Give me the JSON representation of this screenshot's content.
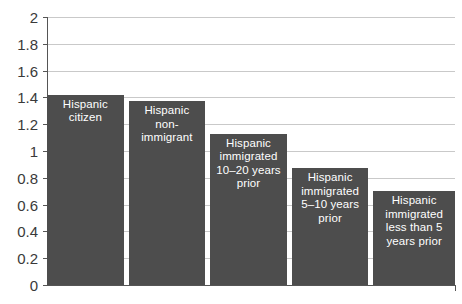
{
  "chart_data": {
    "type": "bar",
    "title": "",
    "subtitle": "",
    "xlabel": "",
    "ylabel": "",
    "ylim": [
      0,
      2
    ],
    "ytick_step": 0.2,
    "grid": true,
    "legend": null,
    "orientation": "vertical",
    "bar_color": "#4d4d4d",
    "label_color": "#ffffff",
    "axis_color": "#555555",
    "gridline_color": "#c9c9c9",
    "background_color": "#ffffff",
    "ytick_labels": [
      "2",
      "1.8",
      "1.6",
      "1.4",
      "1.2",
      "1",
      "0.8",
      "0.6",
      "0.4",
      "0.2",
      "0"
    ],
    "ytick_values": [
      2,
      1.8,
      1.6,
      1.4,
      1.2,
      1,
      0.8,
      0.6,
      0.4,
      0.2,
      0
    ],
    "categories": [
      "Hispanic citizen",
      "Hispanic non-immigrant",
      "Hispanic immigrated 10–20 years prior",
      "Hispanic immigrated 5–10 years prior",
      "Hispanic immigrated less than 5 years prior"
    ],
    "category_labels_wrapped": [
      "Hispanic\ncitizen",
      "Hispanic\nnon-\nimmigrant",
      "Hispanic\nimmigrated\n10–20 years\nprior",
      "Hispanic\nimmigrated\n5–10 years\nprior",
      "Hispanic\nimmigrated\nless than 5\nyears prior"
    ],
    "values": [
      1.42,
      1.37,
      1.13,
      0.87,
      0.7
    ]
  }
}
